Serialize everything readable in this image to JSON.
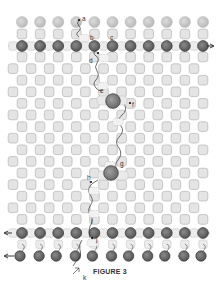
{
  "figure": {
    "caption": "FIGURE 3",
    "colors": {
      "top_circle": "#c8c8c8",
      "square_fill": "#e4e4e4",
      "square_stroke": "#b4b4b4",
      "dark_circle": "#6e6e6e",
      "dark_circle_stroke": "#3a3a3a",
      "big_circle": "#8a8a8a",
      "line": "#333333",
      "dash": "#9a9a9a"
    },
    "labels": {
      "a": "a",
      "b": "b",
      "c": "c",
      "d": "d",
      "e": "e",
      "f": "f",
      "g": "g",
      "h": "h",
      "i": "i",
      "j": "j",
      "k": "k"
    },
    "arrows": {
      "upper_line_direction": "right",
      "lower_line_direction": "left",
      "bottom_row_direction": "left"
    }
  }
}
